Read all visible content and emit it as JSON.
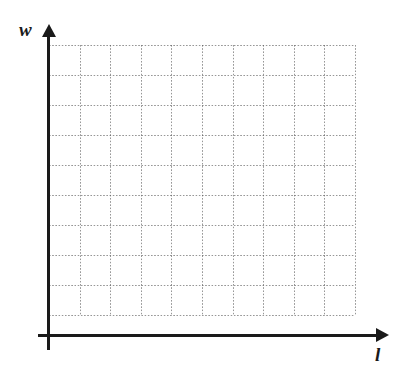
{
  "figure": {
    "title": "",
    "background_color": "#ffffff",
    "axis_color": "#1a1a1a",
    "grid_color": "#575757"
  },
  "axes": {
    "x_label": "l",
    "y_label": "w",
    "x_axis_name": "x-axis-arrow",
    "y_axis_name": "y-axis-arrow"
  },
  "chart_data": {
    "type": "grid",
    "title": "",
    "subtitle": "",
    "xlabel": "l",
    "ylabel": "w",
    "series": [],
    "values": [],
    "categories": [],
    "x": [],
    "xlim": [
      0,
      10
    ],
    "ylim": [
      0,
      9
    ],
    "grid": true,
    "grid_style": "dotted",
    "grid_columns": 10,
    "grid_rows": 9,
    "x_tick_labels": [],
    "y_tick_labels": [],
    "legend": [],
    "legend_position": "none",
    "annotations": []
  },
  "grid": {
    "origin_x": 49,
    "origin_y": 315,
    "cell_width": 30.6,
    "cell_height": 30,
    "vertical_lines": [
      0,
      30.6,
      61.2,
      91.8,
      122.4,
      153,
      183.6,
      214.2,
      244.8,
      275.4,
      306
    ],
    "horizontal_lines": [
      0,
      30,
      60,
      90,
      120,
      150,
      180,
      210,
      240,
      270
    ]
  }
}
